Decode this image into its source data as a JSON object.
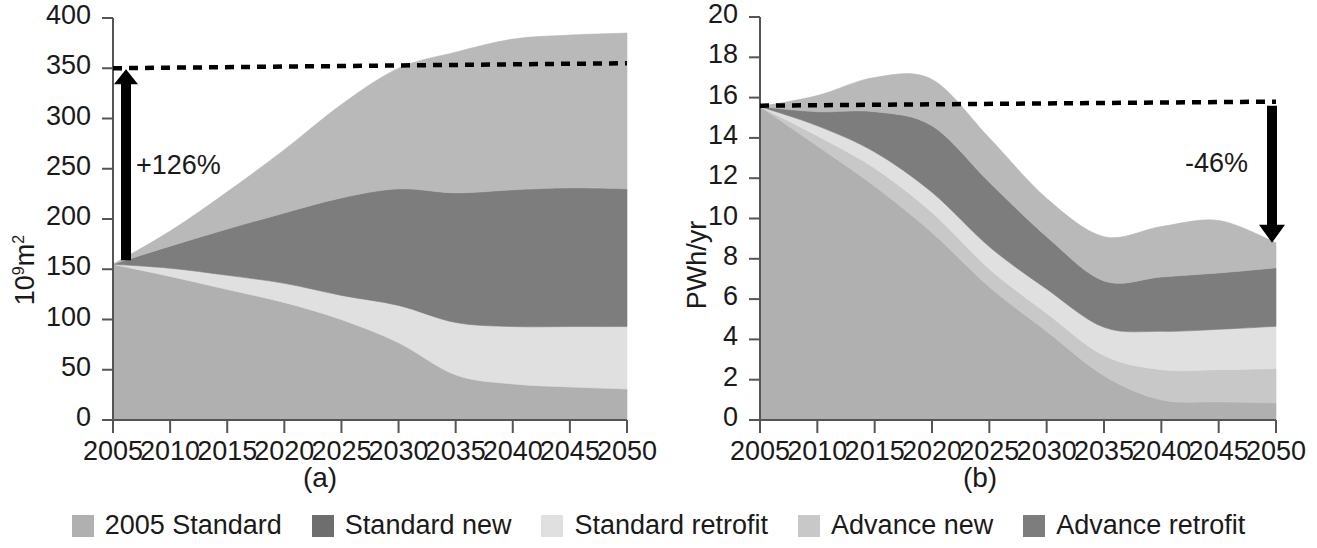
{
  "figure": {
    "panels": [
      {
        "id": "a",
        "caption": "(a)",
        "ylabel_html": "10<sup>9</sup>m<sup>2</sup>",
        "ylabel_text": "10^9 m^2",
        "annotation": "+126%",
        "reference_line_value": 350,
        "reference_line_end_value": 355
      },
      {
        "id": "b",
        "caption": "(b)",
        "ylabel_html": "PWh/yr",
        "ylabel_text": "PWh/yr",
        "annotation": "-46%",
        "reference_line_value": 15.6,
        "reference_line_end_value": 15.8
      }
    ]
  },
  "legend": {
    "position": "bottom-center",
    "items": [
      {
        "label": "2005 Standard",
        "color": "#b0b0b0"
      },
      {
        "label": "Standard new",
        "color": "#6e6e6e"
      },
      {
        "label": "Standard retrofit",
        "color": "#e0e0e0"
      },
      {
        "label": "Advance new",
        "color": "#c8c8c8"
      },
      {
        "label": "Advance retrofit",
        "color": "#7d7d7d"
      }
    ]
  },
  "chart_data": [
    {
      "type": "area",
      "stacked": true,
      "id": "a",
      "title": "(a)",
      "xlabel": "",
      "ylabel": "10^9 m^2",
      "x": [
        2005,
        2010,
        2015,
        2020,
        2025,
        2030,
        2035,
        2040,
        2045,
        2050
      ],
      "xticklabels": [
        "2005",
        "2010",
        "2015",
        "2020",
        "2025",
        "2030",
        "2035",
        "2040",
        "2045",
        "2050"
      ],
      "xlim": [
        2005,
        2050
      ],
      "ylim": [
        0,
        400
      ],
      "yticks": [
        0,
        50,
        100,
        150,
        200,
        250,
        300,
        350,
        400
      ],
      "grid": false,
      "legend_position": "below figure",
      "annotations": [
        {
          "text": "+126%",
          "kind": "double-arrow",
          "from": 155,
          "to": 350,
          "at_x": 2006
        }
      ],
      "reference_line": {
        "style": "dashed",
        "values": [
          350,
          355
        ]
      },
      "series": [
        {
          "name": "2005 Standard",
          "color": "#b0b0b0",
          "values": [
            155,
            143,
            130,
            117,
            100,
            77,
            45,
            36,
            33,
            31
          ]
        },
        {
          "name": "Advance new",
          "color": "#c8c8c8",
          "values": [
            0,
            0,
            0,
            0,
            0,
            0,
            0,
            0,
            0,
            0
          ]
        },
        {
          "name": "Standard retrofit",
          "color": "#e0e0e0",
          "values": [
            0,
            8,
            14,
            19,
            24,
            37,
            52,
            57,
            60,
            62
          ]
        },
        {
          "name": "Advance retrofit",
          "color": "#7d7d7d",
          "values": [
            0,
            22,
            46,
            70,
            97,
            116,
            129,
            136,
            138,
            137
          ]
        },
        {
          "name": "Standard new",
          "color": "#b9b9b9",
          "values": [
            0,
            15,
            37,
            63,
            93,
            120,
            140,
            150,
            152,
            155
          ]
        }
      ],
      "totals": [
        155,
        188,
        227,
        269,
        314,
        350,
        366,
        379,
        383,
        385
      ]
    },
    {
      "type": "area",
      "stacked": true,
      "id": "b",
      "title": "(b)",
      "xlabel": "",
      "ylabel": "PWh/yr",
      "x": [
        2005,
        2010,
        2015,
        2020,
        2025,
        2030,
        2035,
        2040,
        2045,
        2050
      ],
      "xticklabels": [
        "2005",
        "2010",
        "2015",
        "2020",
        "2025",
        "2030",
        "2035",
        "2040",
        "2045",
        "2050"
      ],
      "xlim": [
        2005,
        2050
      ],
      "ylim": [
        0,
        20
      ],
      "yticks": [
        0,
        2,
        4,
        6,
        8,
        10,
        12,
        14,
        16,
        18,
        20
      ],
      "grid": false,
      "legend_position": "below figure",
      "annotations": [
        {
          "text": "-46%",
          "kind": "down-arrow",
          "from": 15.6,
          "to": 8.8,
          "at_x": 2050
        }
      ],
      "reference_line": {
        "style": "dashed",
        "values": [
          15.6,
          15.8
        ]
      },
      "series": [
        {
          "name": "2005 Standard",
          "color": "#b0b0b0",
          "values": [
            15.55,
            13.6,
            11.6,
            9.3,
            6.6,
            4.4,
            2.2,
            1.0,
            0.9,
            0.85
          ]
        },
        {
          "name": "Advance new",
          "color": "#c8c8c8",
          "values": [
            0.0,
            0.5,
            0.9,
            1.0,
            0.9,
            0.9,
            1.0,
            1.5,
            1.6,
            1.7
          ]
        },
        {
          "name": "Standard retrofit",
          "color": "#e0e0e0",
          "values": [
            0.0,
            0.5,
            0.8,
            1.0,
            1.1,
            1.2,
            1.4,
            1.9,
            2.0,
            2.1
          ]
        },
        {
          "name": "Advance retrofit",
          "color": "#7d7d7d",
          "values": [
            0.0,
            0.7,
            2.0,
            3.3,
            3.2,
            2.6,
            2.3,
            2.7,
            2.8,
            2.9
          ]
        },
        {
          "name": "Standard new",
          "color": "#b9b9b9",
          "values": [
            0.0,
            0.8,
            1.7,
            2.3,
            2.2,
            1.9,
            2.2,
            2.5,
            2.6,
            1.25
          ]
        }
      ],
      "totals": [
        15.55,
        16.1,
        17.0,
        16.9,
        14.0,
        11.0,
        9.1,
        9.6,
        9.9,
        8.8
      ]
    }
  ]
}
